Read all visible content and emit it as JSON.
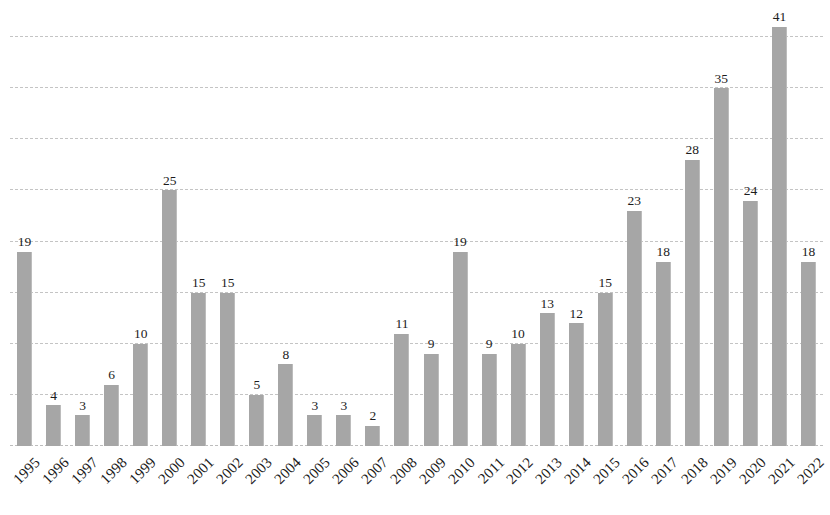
{
  "chart_data": {
    "type": "bar",
    "title": "",
    "subtitle": "",
    "xlabel": "",
    "ylabel": "",
    "categories": [
      "1995",
      "1996",
      "1997",
      "1998",
      "1999",
      "2000",
      "2001",
      "2002",
      "2003",
      "2004",
      "2005",
      "2006",
      "2007",
      "2008",
      "2009",
      "2010",
      "2011",
      "2012",
      "2013",
      "2014",
      "2015",
      "2016",
      "2017",
      "2018",
      "2019",
      "2020",
      "2021",
      "2022"
    ],
    "values": [
      19,
      4,
      3,
      6,
      10,
      25,
      15,
      15,
      5,
      8,
      3,
      3,
      2,
      11,
      9,
      19,
      9,
      10,
      13,
      12,
      15,
      23,
      18,
      28,
      35,
      24,
      41,
      18
    ],
    "data_labels": [
      "19",
      "4",
      "3",
      "6",
      "10",
      "25",
      "15",
      "15",
      "5",
      "8",
      "3",
      "3",
      "2",
      "11",
      "9",
      "19",
      "9",
      "10",
      "13",
      "12",
      "15",
      "23",
      "18",
      "28",
      "35",
      "24",
      "41",
      "18"
    ],
    "ylim": [
      0,
      40
    ],
    "xlim_labels": [
      "1995",
      "2022"
    ],
    "gridlines": {
      "visible": true,
      "axis": "y",
      "values": [
        0,
        5,
        10,
        15,
        20,
        25,
        30,
        35,
        40
      ],
      "style": "dashed",
      "color": "#c4c4c4"
    },
    "y_tick_labels_visible": false,
    "legend": {
      "visible": false,
      "position": "none",
      "entries": []
    },
    "annotations": [],
    "colors": {
      "bar": "#a6a6a6",
      "bar_edge": "#bcbcbc",
      "gridline": "#c4c4c4",
      "label_text": "#1c1c1c",
      "background": "#ffffff"
    },
    "bar_label_position": "above",
    "x_tick_rotation_degrees": -45
  }
}
